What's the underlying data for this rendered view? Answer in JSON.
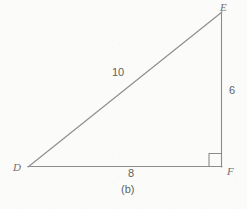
{
  "figure": {
    "caption": "(b)",
    "shape": "right-triangle",
    "stroke_color": "#8c8c8c",
    "background_color": "#fbfbfa",
    "label_color": "#6e6e6e",
    "vertices": [
      {
        "name": "D",
        "label": "D",
        "x": 28,
        "y": 167
      },
      {
        "name": "E",
        "label": "E",
        "x": 222,
        "y": 12
      },
      {
        "name": "F",
        "label": "F",
        "x": 222,
        "y": 167
      }
    ],
    "sides": [
      {
        "name": "DE",
        "label": "10",
        "role": "hypotenuse",
        "from": "D",
        "to": "E"
      },
      {
        "name": "EF",
        "label": "6",
        "role": "leg-vertical",
        "from": "E",
        "to": "F"
      },
      {
        "name": "DF",
        "label": "8",
        "role": "leg-horizontal",
        "from": "D",
        "to": "F"
      }
    ],
    "right_angle": {
      "at_vertex": "F",
      "marker": "square",
      "size": 13
    }
  }
}
